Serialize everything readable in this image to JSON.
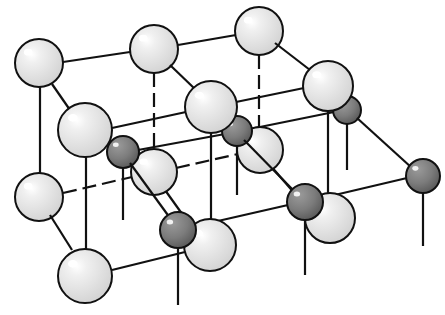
{
  "diagram": {
    "colors": {
      "background": "#ffffff",
      "bond": "#111111",
      "large_ion_fill": "#e8e8e8",
      "large_ion_highlight": "#ffffff",
      "small_ion_fill": "#7c7c7c",
      "small_ion_highlight": "#f2f2f2",
      "outline": "#111111"
    },
    "large_ions": [
      {
        "id": "A",
        "x": 39,
        "y": 63,
        "r": 24
      },
      {
        "id": "B",
        "x": 154,
        "y": 49,
        "r": 24
      },
      {
        "id": "C",
        "x": 259,
        "y": 31,
        "r": 24
      },
      {
        "id": "D",
        "x": 85,
        "y": 130,
        "r": 27
      },
      {
        "id": "E",
        "x": 211,
        "y": 107,
        "r": 26
      },
      {
        "id": "F",
        "x": 328,
        "y": 86,
        "r": 25
      },
      {
        "id": "G",
        "x": 39,
        "y": 197,
        "r": 24
      },
      {
        "id": "H",
        "x": 154,
        "y": 172,
        "r": 23
      },
      {
        "id": "I",
        "x": 260,
        "y": 150,
        "r": 23
      },
      {
        "id": "J",
        "x": 85,
        "y": 276,
        "r": 27
      },
      {
        "id": "K",
        "x": 210,
        "y": 245,
        "r": 26
      },
      {
        "id": "L",
        "x": 330,
        "y": 218,
        "r": 25
      }
    ],
    "small_ions": [
      {
        "id": "a",
        "x": 123,
        "y": 152,
        "r": 16
      },
      {
        "id": "b",
        "x": 237,
        "y": 131,
        "r": 15
      },
      {
        "id": "c",
        "x": 347,
        "y": 110,
        "r": 14
      },
      {
        "id": "d",
        "x": 178,
        "y": 230,
        "r": 18
      },
      {
        "id": "e",
        "x": 305,
        "y": 202,
        "r": 18
      },
      {
        "id": "f",
        "x": 423,
        "y": 176,
        "r": 17
      }
    ],
    "bonds_back": [
      {
        "x1": 154,
        "y1": 73,
        "x2": 154,
        "y2": 150,
        "dashed": true
      },
      {
        "x1": 259,
        "y1": 55,
        "x2": 259,
        "y2": 128,
        "dashed": true
      },
      {
        "x1": 63,
        "y1": 193,
        "x2": 132,
        "y2": 177,
        "dashed": true
      },
      {
        "x1": 176,
        "y1": 168,
        "x2": 238,
        "y2": 154,
        "dashed": true
      },
      {
        "x1": 165,
        "y1": 190,
        "x2": 190,
        "y2": 225,
        "dashed": false
      },
      {
        "x1": 270,
        "y1": 165,
        "x2": 296,
        "y2": 195,
        "dashed": false
      },
      {
        "x1": 138,
        "y1": 150,
        "x2": 225,
        "y2": 134,
        "dashed": false
      },
      {
        "x1": 250,
        "y1": 129,
        "x2": 334,
        "y2": 112,
        "dashed": false
      },
      {
        "x1": 123,
        "y1": 168,
        "x2": 123,
        "y2": 220,
        "dashed": false
      },
      {
        "x1": 237,
        "y1": 146,
        "x2": 237,
        "y2": 195,
        "dashed": false
      },
      {
        "x1": 347,
        "y1": 124,
        "x2": 347,
        "y2": 170,
        "dashed": false
      }
    ],
    "bonds_front": [
      {
        "x1": 63,
        "y1": 62,
        "x2": 130,
        "y2": 52
      },
      {
        "x1": 178,
        "y1": 45,
        "x2": 236,
        "y2": 35
      },
      {
        "x1": 52,
        "y1": 84,
        "x2": 70,
        "y2": 110
      },
      {
        "x1": 170,
        "y1": 65,
        "x2": 196,
        "y2": 90
      },
      {
        "x1": 275,
        "y1": 43,
        "x2": 310,
        "y2": 70
      },
      {
        "x1": 112,
        "y1": 128,
        "x2": 186,
        "y2": 112
      },
      {
        "x1": 236,
        "y1": 102,
        "x2": 304,
        "y2": 88
      },
      {
        "x1": 40,
        "y1": 87,
        "x2": 40,
        "y2": 173
      },
      {
        "x1": 86,
        "y1": 157,
        "x2": 86,
        "y2": 250
      },
      {
        "x1": 211,
        "y1": 133,
        "x2": 211,
        "y2": 220
      },
      {
        "x1": 328,
        "y1": 111,
        "x2": 328,
        "y2": 195
      },
      {
        "x1": 50,
        "y1": 215,
        "x2": 72,
        "y2": 250
      },
      {
        "x1": 112,
        "y1": 270,
        "x2": 185,
        "y2": 252
      },
      {
        "x1": 130,
        "y1": 163,
        "x2": 170,
        "y2": 218
      },
      {
        "x1": 244,
        "y1": 140,
        "x2": 296,
        "y2": 193
      },
      {
        "x1": 357,
        "y1": 118,
        "x2": 412,
        "y2": 168
      },
      {
        "x1": 196,
        "y1": 226,
        "x2": 288,
        "y2": 205
      },
      {
        "x1": 322,
        "y1": 198,
        "x2": 407,
        "y2": 178
      },
      {
        "x1": 178,
        "y1": 248,
        "x2": 178,
        "y2": 305
      },
      {
        "x1": 305,
        "y1": 220,
        "x2": 305,
        "y2": 275
      },
      {
        "x1": 423,
        "y1": 193,
        "x2": 423,
        "y2": 246
      }
    ],
    "draw_order": [
      "C",
      "B",
      "A",
      "I",
      "H",
      "G",
      "c",
      "b",
      "a",
      "F",
      "E",
      "D",
      "L",
      "K",
      "J",
      "f",
      "e",
      "d"
    ]
  }
}
